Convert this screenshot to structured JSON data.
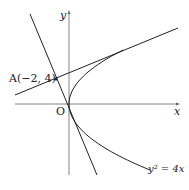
{
  "labels": {
    "y_axis": "y",
    "x_axis": "x",
    "origin": "O",
    "point_a": "A(−2, 4)",
    "curve": "y² = 4x"
  },
  "colors": {
    "stroke": "#222222",
    "axis": "#555555"
  }
}
